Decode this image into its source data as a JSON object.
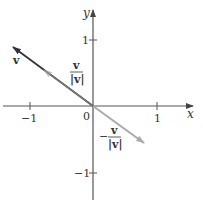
{
  "diagram": {
    "type": "vector_plot",
    "colors": {
      "axis": "#555555",
      "vector_v": "#333333",
      "unit_vector": "#aaaaaa",
      "neg_unit_vector": "#aaaaaa",
      "text": "#333333"
    },
    "axes": {
      "x_label": "x",
      "y_label": "y",
      "origin_label": "0",
      "x_ticks": [
        {
          "value": -1,
          "label": "−1"
        },
        {
          "value": 1,
          "label": "1"
        }
      ],
      "y_ticks": [
        {
          "value": 1,
          "label": "1"
        },
        {
          "value": -1,
          "label": "−1"
        }
      ]
    },
    "vectors": [
      {
        "name": "v",
        "label": "v",
        "from": [
          0,
          0
        ],
        "to": [
          -1.25,
          0.9
        ],
        "style": "dark"
      },
      {
        "name": "unit_v",
        "label_num": "v",
        "label_den": "|v|",
        "from": [
          0,
          0
        ],
        "to": [
          -0.8,
          0.55
        ],
        "style": "light"
      },
      {
        "name": "neg_unit_v",
        "label_sign": "−",
        "label_num": "v",
        "label_den": "|v|",
        "from": [
          0,
          0
        ],
        "to": [
          0.8,
          -0.55
        ],
        "style": "light"
      }
    ]
  }
}
